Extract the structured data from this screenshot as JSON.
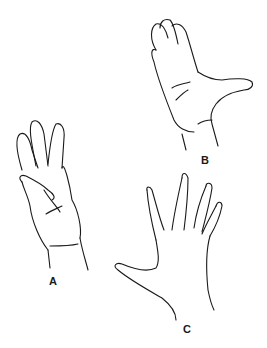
{
  "figure": {
    "stroke_color": "#1a1a1a",
    "background": "#ffffff",
    "panels": [
      {
        "id": "A",
        "label": "A",
        "pose": "thumb folded across palm, four fingers extended"
      },
      {
        "id": "B",
        "label": "B",
        "pose": "fingers together, thumb abducted to the side"
      },
      {
        "id": "C",
        "label": "C",
        "pose": "all fingers spread apart"
      }
    ]
  }
}
